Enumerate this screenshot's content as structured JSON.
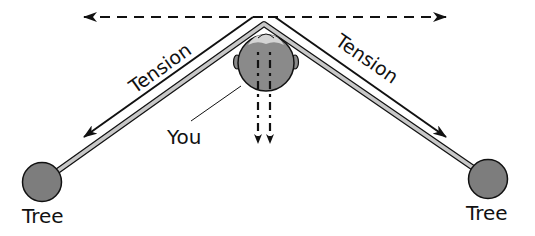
{
  "diagram": {
    "labels": {
      "tension_left": "Tension",
      "tension_right": "Tension",
      "you": "You",
      "tree_left": "Tree",
      "tree_right": "Tree"
    },
    "colors": {
      "line": "#111111",
      "rope_fill": "#c8c8c8",
      "head_fill": "#8a8a8a",
      "tree_fill": "#7d7d7d",
      "background": "#ffffff"
    }
  }
}
